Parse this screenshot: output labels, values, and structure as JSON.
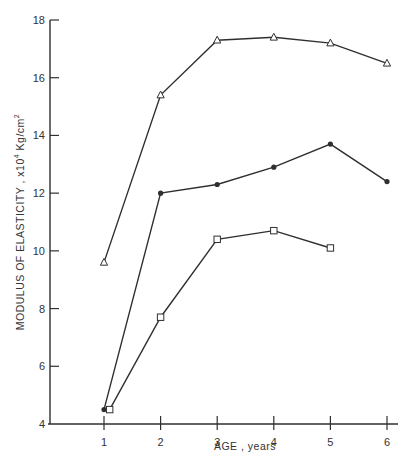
{
  "chart_data": {
    "type": "line",
    "title": "",
    "xlabel": "AGE , years",
    "ylabel": "MODULUS OF ELASTICITY, x10⁴ Kg/cm²",
    "ylabel_parts": {
      "main": "MODULUS OF ELASTICITY , x10",
      "sup1": "4",
      "unit": " Kg/cm",
      "sup2": "2"
    },
    "xlim": [
      0,
      6.2
    ],
    "ylim": [
      4,
      18
    ],
    "xticks": [
      1,
      2,
      3,
      4,
      5,
      6
    ],
    "yticks": [
      4,
      6,
      8,
      10,
      12,
      14,
      16,
      18
    ],
    "grid": false,
    "legend": null,
    "series": [
      {
        "name": "triangle",
        "marker": "triangle-open",
        "x": [
          1,
          2,
          3,
          4,
          5,
          6
        ],
        "values": [
          9.6,
          15.4,
          17.3,
          17.4,
          17.2,
          16.5
        ]
      },
      {
        "name": "circle",
        "marker": "circle-filled",
        "x": [
          1,
          2,
          3,
          4,
          5,
          6
        ],
        "values": [
          4.5,
          12.0,
          12.3,
          12.9,
          13.7,
          12.4
        ]
      },
      {
        "name": "square",
        "marker": "square-open",
        "x": [
          1.1,
          2,
          3,
          4,
          5
        ],
        "values": [
          4.5,
          7.7,
          10.4,
          10.7,
          10.1
        ]
      }
    ]
  },
  "colors": {
    "line": "#2f2f2f",
    "background": "#ffffff"
  }
}
